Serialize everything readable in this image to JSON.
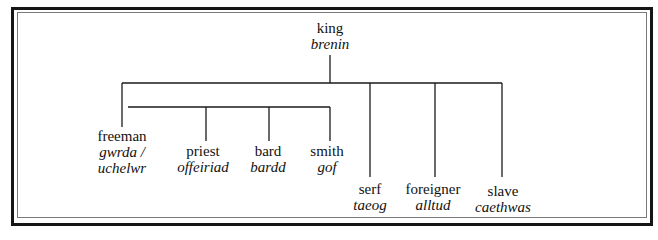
{
  "diagram": {
    "type": "hierarchy",
    "root": {
      "id": "king",
      "english": "king",
      "welsh": "brenin"
    },
    "children": [
      {
        "id": "freeman",
        "english": "freeman",
        "welsh": "gwrda /",
        "welsh_line2": "uchelwr",
        "children": [
          {
            "id": "priest",
            "english": "priest",
            "welsh": "offeiriad"
          },
          {
            "id": "bard",
            "english": "bard",
            "welsh": "bardd"
          },
          {
            "id": "smith",
            "english": "smith",
            "welsh": "gof"
          }
        ]
      },
      {
        "id": "serf",
        "english": "serf",
        "welsh": "taeog"
      },
      {
        "id": "foreigner",
        "english": "foreigner",
        "welsh": "alltud"
      },
      {
        "id": "slave",
        "english": "slave",
        "welsh": "caethwas"
      }
    ]
  },
  "nodes": {
    "king": {
      "en": "king",
      "cy": "brenin"
    },
    "freeman": {
      "en": "freeman",
      "cy": "gwrda /",
      "cy2": "uchelwr"
    },
    "priest": {
      "en": "priest",
      "cy": "offeiriad"
    },
    "bard": {
      "en": "bard",
      "cy": "bardd"
    },
    "smith": {
      "en": "smith",
      "cy": "gof"
    },
    "serf": {
      "en": "serf",
      "cy": "taeog"
    },
    "foreigner": {
      "en": "foreigner",
      "cy": "alltud"
    },
    "slave": {
      "en": "slave",
      "cy": "caethwas"
    }
  },
  "colors": {
    "line": "#1a1a1a",
    "frame": "#151515",
    "background": "#ffffff"
  }
}
